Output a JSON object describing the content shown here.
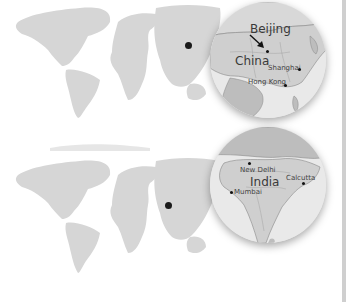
{
  "figure": {
    "panels": [
      {
        "id": "china",
        "marker": {
          "x": 190,
          "y": 44
        },
        "lens": {
          "country_label": "China",
          "capital_label": "Beijing",
          "cities": [
            "Shanghai",
            "Hong Kong"
          ]
        }
      },
      {
        "id": "india",
        "marker": {
          "x": 168,
          "y": 53
        },
        "lens": {
          "country_label": "India",
          "cities": [
            "New Delhi",
            "Mumbai",
            "Calcutta"
          ]
        }
      }
    ]
  },
  "colors": {
    "land_world": "#d4d4d4",
    "lens_country": "#cfcfcf",
    "lens_neighbor": "#bdbdbd",
    "lens_sea": "#e9e9e9",
    "marker": "#1a1a1a",
    "edge_strip": "#cfcfcf"
  }
}
